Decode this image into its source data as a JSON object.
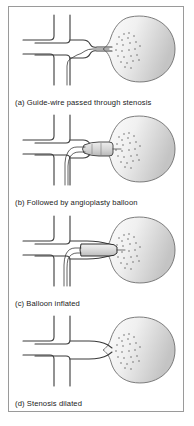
{
  "figure": {
    "type": "medical-illustration",
    "border_color": "#9a9a9a",
    "background_color": "#ffffff",
    "vessel_outline_color": "#3a3a3a",
    "kidney_outline_color": "#6e6e6e",
    "kidney_fill_light": "#fcfcfc",
    "kidney_fill_dark": "#c8c8c8",
    "balloon_fill": "#d8d8d8",
    "stipple_color": "#555555",
    "panels": [
      {
        "id": "a",
        "label": "(a)",
        "caption": "(a) Guide-wire passed through stenosis",
        "caption_text": "Guide-wire passed through stenosis",
        "state": "guidewire-through-stenosis"
      },
      {
        "id": "b",
        "label": "(b)",
        "caption": "(b) Followed by angioplasty balloon",
        "caption_text": "Followed by angioplasty balloon",
        "state": "balloon-deflated-in-place"
      },
      {
        "id": "c",
        "label": "(c)",
        "caption": "(c) Balloon inflated",
        "caption_text": "Balloon inflated",
        "state": "balloon-inflated"
      },
      {
        "id": "d",
        "label": "(d)",
        "caption": "(d) Stenosis dilated",
        "caption_text": "Stenosis dilated",
        "state": "stenosis-dilated-catheter-removed"
      }
    ],
    "anatomy": {
      "aorta_label": "aorta",
      "renal_artery_label": "renal artery",
      "kidney_label": "kidney",
      "stenosis_label": "stenosis"
    }
  }
}
